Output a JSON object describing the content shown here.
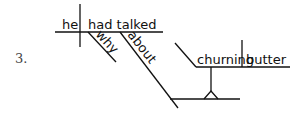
{
  "item_number": "3.",
  "diagram": {
    "type": "sentence-diagram",
    "subject": "he",
    "verb": "had talked",
    "modifiers": [
      "why"
    ],
    "preposition": "about",
    "gerund_phrase": {
      "gerund": "churning",
      "object": "butter"
    }
  }
}
